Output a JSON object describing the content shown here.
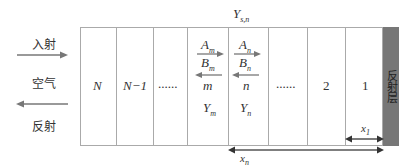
{
  "diagram": {
    "top_label": "Y",
    "top_label_sub": "s,n",
    "left": {
      "incident_label": "入射",
      "medium_label": "空气",
      "reflected_label": "反射"
    },
    "layers": [
      {
        "label": "N"
      },
      {
        "label": "N−1"
      },
      {
        "label": "......"
      },
      {
        "label": "m",
        "A": "A",
        "A_sub": "m",
        "B": "B",
        "B_sub": "m",
        "Y": "Y",
        "Y_sub": "m"
      },
      {
        "label": "n",
        "A": "A",
        "A_sub": "n",
        "B": "B",
        "B_sub": "n",
        "Y": "Y",
        "Y_sub": "n"
      },
      {
        "label": "......"
      },
      {
        "label": "2"
      },
      {
        "label": "1"
      }
    ],
    "reflector_label": "反射层",
    "dimensions": {
      "x1": "x",
      "x1_sub": "1",
      "xn": "x",
      "xn_sub": "n"
    },
    "colors": {
      "arrow": "#777777",
      "border": "#aaaaaa",
      "reflector": "#777777",
      "dim_arrow": "#333333"
    }
  }
}
